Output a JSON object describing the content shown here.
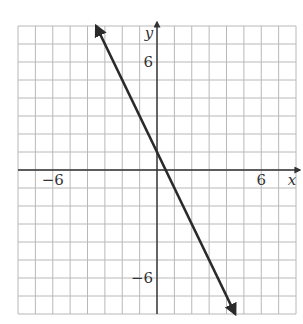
{
  "chart_data": {
    "type": "line",
    "title": "",
    "xlabel": "x",
    "ylabel": "y",
    "xlim": [
      -8,
      8
    ],
    "ylim": [
      -8,
      8
    ],
    "grid": true,
    "grid_step": 1,
    "x_tick_labels": [
      {
        "value": -6,
        "label": "−6"
      },
      {
        "value": 6,
        "label": "6"
      }
    ],
    "y_tick_labels": [
      {
        "value": 6,
        "label": "6"
      },
      {
        "value": -6,
        "label": "−6"
      }
    ],
    "series": [
      {
        "name": "line",
        "equation": "y = -2x + 1",
        "slope": -2,
        "intercept": 1,
        "x": [
          -3.5,
          4.5
        ],
        "y": [
          8,
          -8
        ],
        "arrows_both_ends": true
      }
    ]
  },
  "colors": {
    "grid": "#b8b8b8",
    "axis": "#333333",
    "line": "#2a2a2a",
    "background": "#ffffff"
  }
}
